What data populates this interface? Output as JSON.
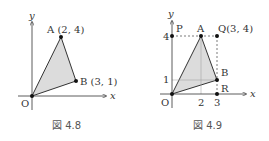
{
  "figures": [
    {
      "caption": "図 4.8",
      "axis_labels": {
        "x": "x",
        "y": "y"
      },
      "origin_label": "O",
      "points": {
        "A": {
          "label": "A (2, 4)"
        },
        "B": {
          "label": "B (3, 1)"
        }
      },
      "shaded_triangle": [
        "O",
        "A",
        "B"
      ]
    },
    {
      "caption": "図 4.9",
      "axis_labels": {
        "x": "x",
        "y": "y"
      },
      "origin_label": "O",
      "points": {
        "P": {
          "label": "P"
        },
        "A": {
          "label": "A"
        },
        "Q": {
          "label": "Q(3, 4)"
        },
        "B": {
          "label": "B"
        },
        "R": {
          "label": "R"
        }
      },
      "ticks": {
        "x": [
          "2",
          "3"
        ],
        "y": [
          "1",
          "4"
        ]
      },
      "shaded_triangle": [
        "O",
        "A",
        "B"
      ]
    }
  ],
  "colors": {
    "shade": "#dcdcdc",
    "line": "#333333",
    "dash": "#444444"
  }
}
